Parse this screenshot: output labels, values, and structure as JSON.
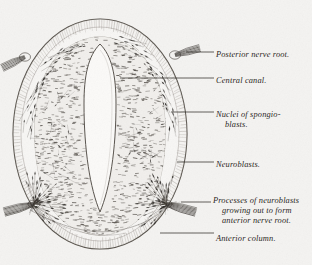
{
  "figure": {
    "background_color": "#f4f3f1",
    "ink_color": "#2b2724"
  },
  "labels": [
    {
      "id": "posterior-nerve-root",
      "text": "Posterior nerve root.",
      "x": 216,
      "y": 50
    },
    {
      "id": "central-canal",
      "text": "Central canal.",
      "x": 216,
      "y": 76
    },
    {
      "id": "nuclei-of-spongioblasts-1",
      "text": "Nuclei of spongio-",
      "x": 216,
      "y": 110
    },
    {
      "id": "nuclei-of-spongioblasts-2",
      "text": "blasts.",
      "x": 225,
      "y": 120
    },
    {
      "id": "neuroblasts",
      "text": "Neuroblasts.",
      "x": 216,
      "y": 160
    },
    {
      "id": "processes-line-1",
      "text": "Processes of neuroblasts",
      "x": 213,
      "y": 196
    },
    {
      "id": "processes-line-2",
      "text": "growing out to form",
      "x": 222,
      "y": 206
    },
    {
      "id": "processes-line-3",
      "text": "anterior nerve root.",
      "x": 222,
      "y": 216
    },
    {
      "id": "anterior-column",
      "text": "Anterior column.",
      "x": 216,
      "y": 234
    }
  ],
  "leader_lines": [
    {
      "id": "leader-posterior-nerve-root",
      "x1": 186,
      "y1": 52,
      "x2": 214,
      "y2": 52
    },
    {
      "id": "leader-central-canal",
      "x1": 120,
      "y1": 78,
      "x2": 214,
      "y2": 78
    },
    {
      "id": "leader-nuclei-spongioblasts",
      "x1": 171,
      "y1": 112,
      "x2": 214,
      "y2": 112
    },
    {
      "id": "leader-neuroblasts",
      "x1": 177,
      "y1": 162,
      "x2": 214,
      "y2": 162
    },
    {
      "id": "leader-processes",
      "x1": 181,
      "y1": 202,
      "x2": 211,
      "y2": 202
    },
    {
      "id": "leader-anterior-column",
      "x1": 160,
      "y1": 233,
      "x2": 214,
      "y2": 233
    }
  ],
  "structures": {
    "outer_oval": {
      "cx": 100,
      "cy": 134,
      "rx": 88,
      "ry": 116
    },
    "central_canal": {
      "cx": 100,
      "cy": 110,
      "note": "narrow pointed white lumen"
    },
    "gray_matter": {
      "note": "stippled butterfly-shaped gray matter"
    },
    "posterior_nerve_roots": {
      "count": 2,
      "note": "dorsal root fibre bundles left and right"
    },
    "anterior_nerve_roots": {
      "count": 2,
      "note": "ventral root fibre bundles left and right"
    },
    "neuroblast_clusters": {
      "count": 4,
      "note": "dark fusiform cells in fan groups"
    }
  }
}
